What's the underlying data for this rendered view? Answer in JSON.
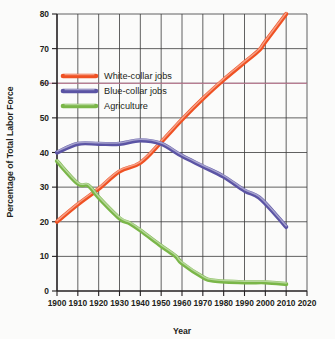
{
  "chart_data": {
    "type": "line",
    "title": "",
    "xlabel": "Year",
    "ylabel": "Percentage of Total Labor Force",
    "xlim": [
      1900,
      2020
    ],
    "ylim": [
      0,
      80
    ],
    "xticks": [
      1900,
      1910,
      1920,
      1930,
      1940,
      1950,
      1960,
      1970,
      1980,
      1990,
      2000,
      2010,
      2020
    ],
    "yticks": [
      0,
      10,
      20,
      30,
      40,
      50,
      60,
      70,
      80
    ],
    "grid": true,
    "legend_position": "upper-left-inside",
    "reference_line_y": 60,
    "colors": {
      "white_collar": "#ef5123",
      "blue_collar": "#5b54a4",
      "agriculture": "#77b martial"
    },
    "series": [
      {
        "name": "White-collar jobs",
        "color": "#ef5123",
        "x": [
          1900,
          1910,
          1920,
          1930,
          1940,
          1950,
          1960,
          1970,
          1980,
          1990,
          1997,
          2000,
          2010
        ],
        "values": [
          20,
          25,
          29.5,
          34.5,
          37,
          43,
          49.5,
          55.5,
          61,
          66,
          69.5,
          72,
          80
        ]
      },
      {
        "name": "Blue-collar jobs",
        "color": "#5b54a4",
        "x": [
          1900,
          1910,
          1920,
          1930,
          1940,
          1950,
          1960,
          1970,
          1980,
          1990,
          1997,
          2005,
          2010
        ],
        "values": [
          40,
          42.5,
          42.5,
          42.5,
          43.5,
          42.5,
          39,
          36,
          33,
          29,
          27,
          22,
          18.5
        ]
      },
      {
        "name": "Agriculture",
        "color": "#7ab648",
        "x": [
          1900,
          1910,
          1915,
          1920,
          1930,
          1935,
          1940,
          1950,
          1957,
          1960,
          1970,
          1975,
          1990,
          2000,
          2010
        ],
        "values": [
          37.5,
          31,
          30.5,
          27,
          21,
          19.5,
          17.5,
          13,
          10,
          8,
          4,
          3,
          2.5,
          2.5,
          2
        ]
      }
    ]
  },
  "legend": {
    "items": [
      {
        "label": "White-collar jobs",
        "color": "#ef5123"
      },
      {
        "label": "Blue-collar jobs",
        "color": "#5b54a4"
      },
      {
        "label": "Agriculture",
        "color": "#7ab648"
      }
    ]
  },
  "axes": {
    "x_title": "Year",
    "y_title": "Percentage of Total Labor Force",
    "x_tick_labels": [
      "1900",
      "1910",
      "1920",
      "1930",
      "1940",
      "1950",
      "1960",
      "1970",
      "1980",
      "1990",
      "2000",
      "2010",
      "2020"
    ],
    "y_tick_labels": [
      "0",
      "10",
      "20",
      "30",
      "40",
      "50",
      "60",
      "70",
      "80"
    ]
  }
}
